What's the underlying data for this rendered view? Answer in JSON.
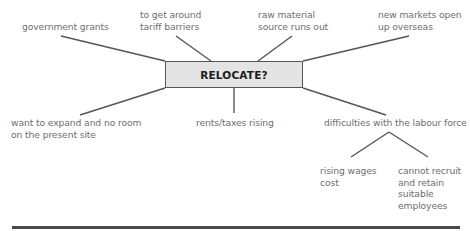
{
  "center": {
    "label": "RELOCATE?"
  },
  "nodes": [
    {
      "id": "government-grants",
      "label_lines": [
        "government grants"
      ]
    },
    {
      "id": "tariff-barriers",
      "label_lines": [
        "to get around",
        "tariff barriers"
      ]
    },
    {
      "id": "raw-material",
      "label_lines": [
        "raw material",
        "source runs out"
      ]
    },
    {
      "id": "new-markets",
      "label_lines": [
        "new markets open",
        "up overseas"
      ]
    },
    {
      "id": "expand",
      "label_lines": [
        "want to expand and no room",
        "on the present site"
      ]
    },
    {
      "id": "rents-taxes",
      "label_lines": [
        "rents/taxes rising"
      ]
    },
    {
      "id": "labour-force",
      "label_lines": [
        "difficulties with the labour force"
      ],
      "children": [
        {
          "id": "rising-wages",
          "label_lines": [
            "rising wages",
            "cost"
          ]
        },
        {
          "id": "recruit-retain",
          "label_lines": [
            "cannot recruit",
            "and retain",
            "suitable",
            "employees"
          ]
        }
      ]
    }
  ],
  "colors": {
    "box_fill": "#e4e4e4",
    "line": "#555555",
    "text": "#6e6e6e"
  }
}
